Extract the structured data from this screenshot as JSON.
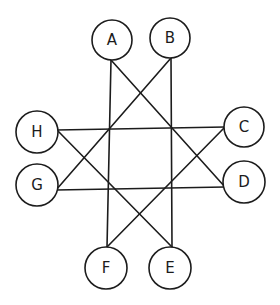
{
  "diagram": {
    "type": "graph",
    "background": "#ffffff",
    "stroke_color": "#1c1c1c",
    "nodes": [
      {
        "id": "A",
        "label": "A",
        "cx": 112,
        "cy": 40,
        "r": 20
      },
      {
        "id": "B",
        "label": "B",
        "cx": 170,
        "cy": 38,
        "r": 20
      },
      {
        "id": "C",
        "label": "C",
        "cx": 244,
        "cy": 127,
        "r": 20
      },
      {
        "id": "D",
        "label": "D",
        "cx": 244,
        "cy": 182,
        "r": 21
      },
      {
        "id": "E",
        "label": "E",
        "cx": 170,
        "cy": 268,
        "r": 21
      },
      {
        "id": "F",
        "label": "F",
        "cx": 106,
        "cy": 268,
        "r": 21
      },
      {
        "id": "G",
        "label": "G",
        "cx": 37,
        "cy": 185,
        "r": 21
      },
      {
        "id": "H",
        "label": "H",
        "cx": 37,
        "cy": 132,
        "r": 21
      }
    ],
    "edges": [
      {
        "from": "A",
        "to": "F",
        "x1": 111,
        "y1": 60,
        "x2": 107,
        "y2": 247
      },
      {
        "from": "A",
        "to": "D",
        "x1": 111,
        "y1": 60,
        "x2": 225,
        "y2": 187
      },
      {
        "from": "B",
        "to": "E",
        "x1": 171,
        "y1": 58,
        "x2": 172,
        "y2": 247
      },
      {
        "from": "B",
        "to": "G",
        "x1": 171,
        "y1": 58,
        "x2": 56,
        "y2": 190
      },
      {
        "from": "H",
        "to": "C",
        "x1": 57,
        "y1": 130,
        "x2": 225,
        "y2": 127
      },
      {
        "from": "H",
        "to": "E",
        "x1": 57,
        "y1": 130,
        "x2": 172,
        "y2": 247
      },
      {
        "from": "G",
        "to": "D",
        "x1": 56,
        "y1": 190,
        "x2": 225,
        "y2": 187
      },
      {
        "from": "C",
        "to": "F",
        "x1": 225,
        "y1": 127,
        "x2": 107,
        "y2": 247
      }
    ]
  }
}
